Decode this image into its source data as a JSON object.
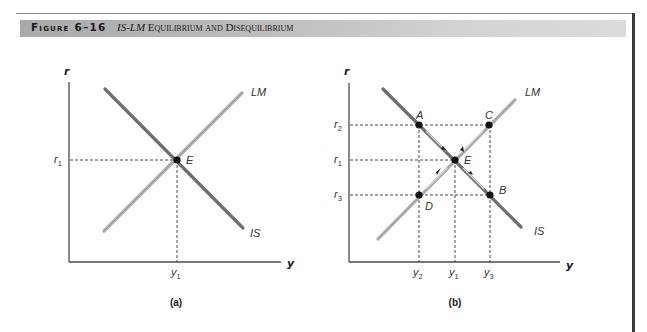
{
  "figure": {
    "number": "Figure 6–16",
    "title_italic": "IS-LM",
    "title_rest": " Equilibrium and Disequilibrium"
  },
  "panels": [
    {
      "caption": "(a)",
      "axis_y_label": "r",
      "axis_x_label": "y",
      "curves": {
        "is": "IS",
        "lm": "LM"
      },
      "points": [
        {
          "label": "E"
        }
      ],
      "y_ticks": [
        {
          "base": "r",
          "sub": "1"
        }
      ],
      "x_ticks": [
        {
          "base": "y",
          "sub": "1"
        }
      ]
    },
    {
      "caption": "(b)",
      "axis_y_label": "r",
      "axis_x_label": "y",
      "curves": {
        "is": "IS",
        "lm": "LM"
      },
      "points": [
        {
          "label": "A"
        },
        {
          "label": "B"
        },
        {
          "label": "C"
        },
        {
          "label": "D"
        },
        {
          "label": "E"
        }
      ],
      "y_ticks": [
        {
          "base": "r",
          "sub": "2"
        },
        {
          "base": "r",
          "sub": "1"
        },
        {
          "base": "r",
          "sub": "3"
        }
      ],
      "x_ticks": [
        {
          "base": "y",
          "sub": "2"
        },
        {
          "base": "y",
          "sub": "1"
        },
        {
          "base": "y",
          "sub": "3"
        }
      ]
    }
  ],
  "colors": {
    "is_curve": "#6e6e6e",
    "lm_curve": "#a8a8a8",
    "axis": "#4a4a4a",
    "point": "#111111",
    "header_band": "#bdbdbd"
  }
}
